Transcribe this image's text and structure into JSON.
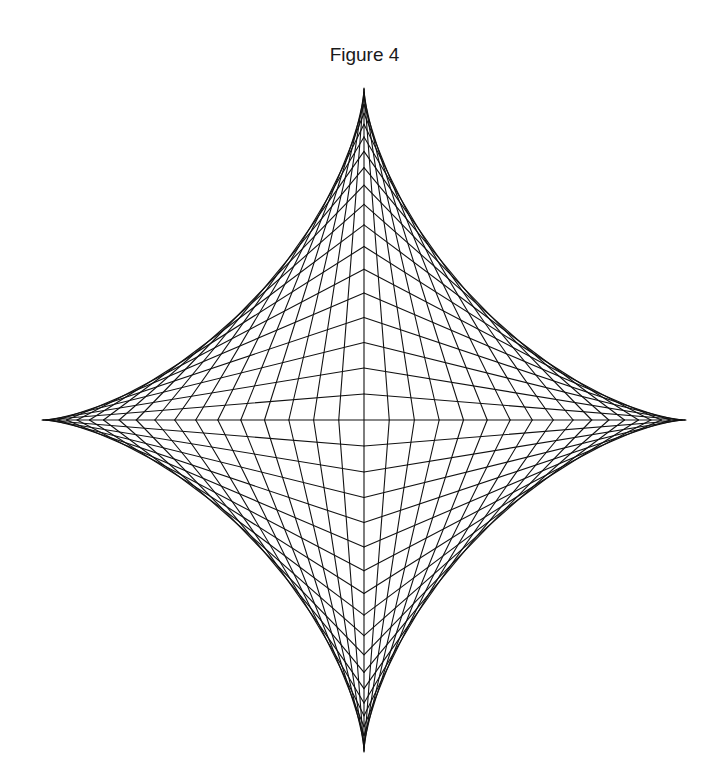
{
  "figure": {
    "title": "Figure 4",
    "line_color": "#111111",
    "background": "#ffffff"
  },
  "geometry": {
    "center": [
      364,
      420
    ],
    "radius_x": 322,
    "radius_y": 332,
    "divisions_per_quadrant": 20,
    "cusps": {
      "top": [
        364,
        88
      ],
      "bottom": [
        364,
        752
      ],
      "left": [
        42,
        420
      ],
      "right": [
        686,
        420
      ]
    }
  }
}
